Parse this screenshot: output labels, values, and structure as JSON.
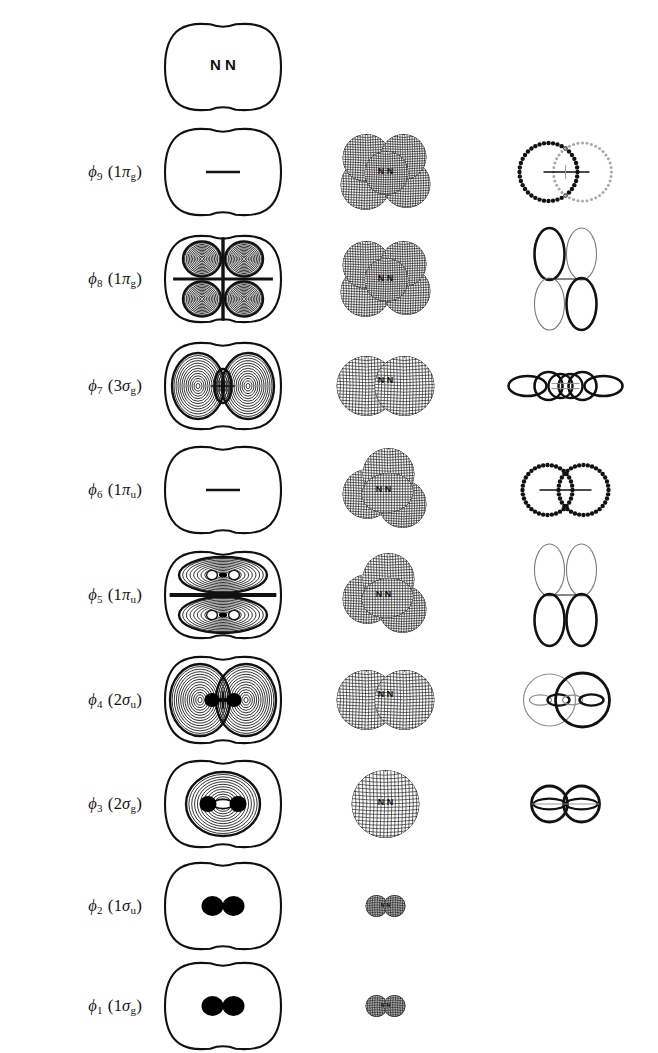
{
  "figure": {
    "title_fragment": "",
    "molecule": "N2",
    "nuclei_labels": [
      "N",
      "N"
    ],
    "columns": [
      {
        "key": "label",
        "name": "orbital-label-column",
        "header": ""
      },
      {
        "key": "contour",
        "name": "contour-plot-column",
        "header": ""
      },
      {
        "key": "mesh",
        "name": "mesh-surface-column",
        "header": ""
      },
      {
        "key": "schem",
        "name": "schematic-overlap-column",
        "header": ""
      }
    ],
    "line_color": "#111111",
    "fill_color": "#000000",
    "light_line_color": "#8a8a8a"
  },
  "rows": [
    {
      "id": "row-nuclei",
      "label": {
        "text": "",
        "phi": "",
        "index": "",
        "term": "",
        "sub": ""
      },
      "y": 16,
      "height": 102,
      "contour": {
        "kind": "outline-nuclei",
        "nuclei": [
          "N",
          "N"
        ]
      },
      "mesh": {
        "kind": "none"
      },
      "schem": {
        "kind": "none"
      }
    },
    {
      "id": "row-phi9",
      "label": {
        "text": "φ9 (1πg)",
        "phi": "ϕ",
        "index": "9",
        "term": "1π",
        "sub": "g"
      },
      "y": 122,
      "height": 100,
      "contour": {
        "kind": "outline-node-dash"
      },
      "mesh": {
        "kind": "pi-four-lobe",
        "scale": 1.0,
        "nuclei": [
          "N",
          "N"
        ]
      },
      "schem": {
        "kind": "two-dotted-circles",
        "left_weight": "bold",
        "right_weight": "light",
        "bar": true
      }
    },
    {
      "id": "row-phi8",
      "label": {
        "text": "φ8 (1πg)",
        "phi": "ϕ",
        "index": "8",
        "term": "1π",
        "sub": "g"
      },
      "y": 226,
      "height": 106,
      "contour": {
        "kind": "contour-four-lobe"
      },
      "mesh": {
        "kind": "pi-four-lobe",
        "scale": 1.0,
        "nuclei": [
          "N",
          "N"
        ]
      },
      "schem": {
        "kind": "four-vertical-ellipses",
        "pattern": [
          "bold",
          "light",
          "light",
          "bold"
        ],
        "bar": true
      }
    },
    {
      "id": "row-phi7",
      "label": {
        "text": "φ7 (3σg)",
        "phi": "ϕ",
        "index": "7",
        "term": "3σ",
        "sub": "g"
      },
      "y": 334,
      "height": 104,
      "contour": {
        "kind": "contour-sigma-3g"
      },
      "mesh": {
        "kind": "sigma-two-sphere",
        "scale": 1.0,
        "nuclei": [
          "N",
          "N"
        ]
      },
      "schem": {
        "kind": "sigma-chain-4",
        "bar": true
      }
    },
    {
      "id": "row-phi6",
      "label": {
        "text": "φ6 (1πu)",
        "phi": "ϕ",
        "index": "6",
        "term": "1π",
        "sub": "u"
      },
      "y": 440,
      "height": 100,
      "contour": {
        "kind": "outline-node-dash"
      },
      "mesh": {
        "kind": "pi-u-lobes",
        "scale": 1.0,
        "nuclei": [
          "N",
          "N"
        ]
      },
      "schem": {
        "kind": "two-dotted-circles-tangent",
        "left_weight": "bold",
        "right_weight": "bold",
        "bar": true
      }
    },
    {
      "id": "row-phi5",
      "label": {
        "text": "φ5 (1πu)",
        "phi": "ϕ",
        "index": "5",
        "term": "1π",
        "sub": "u"
      },
      "y": 542,
      "height": 106,
      "contour": {
        "kind": "contour-pi-u"
      },
      "mesh": {
        "kind": "pi-u-lobes",
        "scale": 1.0,
        "nuclei": [
          "N",
          "N"
        ]
      },
      "schem": {
        "kind": "four-vertical-ellipses",
        "pattern": [
          "light",
          "light",
          "bold",
          "bold"
        ],
        "bar": true
      }
    },
    {
      "id": "row-phi4",
      "label": {
        "text": "φ4 (2σu)",
        "phi": "ϕ",
        "index": "4",
        "term": "2σ",
        "sub": "u"
      },
      "y": 648,
      "height": 104,
      "contour": {
        "kind": "contour-sigma-2u"
      },
      "mesh": {
        "kind": "sigma-two-sphere",
        "scale": 1.0,
        "nuclei": [
          "N",
          "N"
        ]
      },
      "schem": {
        "kind": "sigma-u-two-circles",
        "left_weight": "light",
        "right_weight": "bold"
      }
    },
    {
      "id": "row-phi3",
      "label": {
        "text": "φ3 (2σg)",
        "phi": "ϕ",
        "index": "3",
        "term": "2σ",
        "sub": "g"
      },
      "y": 752,
      "height": 104,
      "contour": {
        "kind": "contour-sigma-2g"
      },
      "mesh": {
        "kind": "sigma-one-sphere",
        "scale": 1.0,
        "nuclei": [
          "N",
          "N"
        ]
      },
      "schem": {
        "kind": "sigma-g-two-circles"
      }
    },
    {
      "id": "row-phi2",
      "label": {
        "text": "φ2 (1σu)",
        "phi": "ϕ",
        "index": "2",
        "term": "1σ",
        "sub": "u"
      },
      "y": 856,
      "height": 100,
      "contour": {
        "kind": "outline-two-dots"
      },
      "mesh": {
        "kind": "core-two-sphere",
        "scale": 0.34,
        "nuclei": [
          "N",
          "N"
        ]
      },
      "schem": {
        "kind": "none"
      }
    },
    {
      "id": "row-phi1",
      "label": {
        "text": "φ1 (1σg)",
        "phi": "ϕ",
        "index": "1",
        "term": "1σ",
        "sub": "g"
      },
      "y": 956,
      "height": 100,
      "contour": {
        "kind": "outline-two-dots"
      },
      "mesh": {
        "kind": "core-two-sphere",
        "scale": 0.34,
        "nuclei": [
          "N",
          "N"
        ]
      },
      "schem": {
        "kind": "none"
      }
    }
  ]
}
